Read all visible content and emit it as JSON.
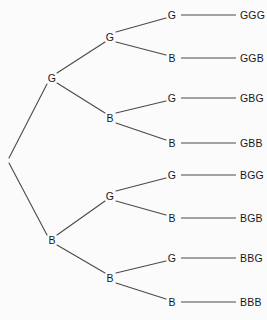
{
  "diagram": {
    "type": "probability-tree-diagram",
    "title": "",
    "colors": {
      "background": "#fbfbfb",
      "line": "#4a4a4a",
      "text": "#17171b"
    },
    "root": {
      "label": "",
      "x": 7,
      "y": 160
    },
    "level1": [
      {
        "id": "n-g",
        "label": "G",
        "x": 52,
        "y": 78
      },
      {
        "id": "n-b",
        "label": "B",
        "x": 52,
        "y": 240
      }
    ],
    "level2": [
      {
        "id": "n-gg",
        "label": "G",
        "x": 110,
        "y": 37
      },
      {
        "id": "n-gb",
        "label": "B",
        "x": 110,
        "y": 118
      },
      {
        "id": "n-bg",
        "label": "G",
        "x": 110,
        "y": 196
      },
      {
        "id": "n-bb",
        "label": "B",
        "x": 110,
        "y": 278
      }
    ],
    "level3": [
      {
        "id": "n-ggg",
        "label": "G",
        "x": 172,
        "y": 15,
        "outcome": "GGG"
      },
      {
        "id": "n-ggb",
        "label": "B",
        "x": 172,
        "y": 58,
        "outcome": "GGB"
      },
      {
        "id": "n-gbg",
        "label": "G",
        "x": 172,
        "y": 98,
        "outcome": "GBG"
      },
      {
        "id": "n-gbb",
        "label": "B",
        "x": 172,
        "y": 143,
        "outcome": "GBB"
      },
      {
        "id": "n-bgg",
        "label": "G",
        "x": 172,
        "y": 175,
        "outcome": "BGG"
      },
      {
        "id": "n-bgb",
        "label": "B",
        "x": 172,
        "y": 218,
        "outcome": "BGB"
      },
      {
        "id": "n-bbg",
        "label": "G",
        "x": 172,
        "y": 258,
        "outcome": "BBG"
      },
      {
        "id": "n-bbb",
        "label": "B",
        "x": 172,
        "y": 302,
        "outcome": "BBB"
      }
    ],
    "outcome_label_x": 240,
    "rule": {
      "x1": 181,
      "x2": 236
    },
    "edges": [
      {
        "x1": 9,
        "y1": 158,
        "x2": 47,
        "y2": 84,
        "name": "edge-root-to-g"
      },
      {
        "x1": 9,
        "y1": 163,
        "x2": 47,
        "y2": 235,
        "name": "edge-root-to-b"
      },
      {
        "x1": 57,
        "y1": 73,
        "x2": 105,
        "y2": 42,
        "name": "edge-g-to-gg"
      },
      {
        "x1": 57,
        "y1": 83,
        "x2": 105,
        "y2": 113,
        "name": "edge-g-to-gb"
      },
      {
        "x1": 57,
        "y1": 235,
        "x2": 105,
        "y2": 201,
        "name": "edge-b-to-bg"
      },
      {
        "x1": 57,
        "y1": 245,
        "x2": 105,
        "y2": 273,
        "name": "edge-b-to-bb"
      },
      {
        "x1": 116,
        "y1": 32,
        "x2": 166,
        "y2": 18,
        "name": "edge-gg-to-ggg"
      },
      {
        "x1": 116,
        "y1": 42,
        "x2": 166,
        "y2": 55,
        "name": "edge-gg-to-ggb"
      },
      {
        "x1": 116,
        "y1": 113,
        "x2": 166,
        "y2": 101,
        "name": "edge-gb-to-gbg"
      },
      {
        "x1": 116,
        "y1": 123,
        "x2": 166,
        "y2": 140,
        "name": "edge-gb-to-gbb"
      },
      {
        "x1": 116,
        "y1": 191,
        "x2": 166,
        "y2": 178,
        "name": "edge-bg-to-bgg"
      },
      {
        "x1": 116,
        "y1": 201,
        "x2": 166,
        "y2": 215,
        "name": "edge-bg-to-bgb"
      },
      {
        "x1": 116,
        "y1": 273,
        "x2": 166,
        "y2": 261,
        "name": "edge-bb-to-bbg"
      },
      {
        "x1": 116,
        "y1": 283,
        "x2": 166,
        "y2": 299,
        "name": "edge-bb-to-bbb"
      }
    ]
  }
}
